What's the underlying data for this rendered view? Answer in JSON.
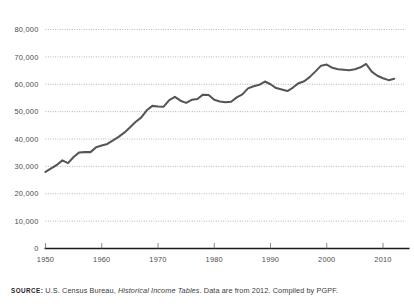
{
  "chart_data": {
    "type": "line",
    "title": "",
    "subtitle": "",
    "xlabel": "",
    "ylabel": "",
    "xlim": [
      1950,
      2014
    ],
    "ylim": [
      0,
      80000
    ],
    "grid": "horizontal-dotted",
    "legend": "none",
    "series_color": "#555555",
    "x_ticks": [
      "1950",
      "1960",
      "1970",
      "1980",
      "1990",
      "2000",
      "2010"
    ],
    "x_tick_values": [
      1950,
      1960,
      1970,
      1980,
      1990,
      2000,
      2010
    ],
    "y_ticks": [
      "0",
      "10,000",
      "20,000",
      "30,000",
      "40,000",
      "50,000",
      "60,000",
      "70,000",
      "80,000"
    ],
    "y_tick_values": [
      0,
      10000,
      20000,
      30000,
      40000,
      50000,
      60000,
      70000,
      80000
    ],
    "series": [
      {
        "name": "Median household income",
        "x": [
          1950,
          1951,
          1952,
          1953,
          1954,
          1955,
          1956,
          1957,
          1958,
          1959,
          1960,
          1961,
          1962,
          1963,
          1964,
          1965,
          1966,
          1967,
          1968,
          1969,
          1970,
          1971,
          1972,
          1973,
          1974,
          1975,
          1976,
          1977,
          1978,
          1979,
          1980,
          1981,
          1982,
          1983,
          1984,
          1985,
          1986,
          1987,
          1988,
          1989,
          1990,
          1991,
          1992,
          1993,
          1994,
          1995,
          1996,
          1997,
          1998,
          1999,
          2000,
          2001,
          2002,
          2003,
          2004,
          2005,
          2006,
          2007,
          2008,
          2009,
          2010,
          2011,
          2012
        ],
        "values": [
          28000,
          29300,
          30500,
          32200,
          31200,
          33400,
          35100,
          35200,
          35200,
          37000,
          37600,
          38200,
          39500,
          40800,
          42300,
          44200,
          46200,
          47800,
          50500,
          52100,
          51900,
          51800,
          54200,
          55400,
          54000,
          53200,
          54300,
          54600,
          56200,
          56100,
          54300,
          53700,
          53400,
          53600,
          55200,
          56300,
          58500,
          59300,
          59800,
          61000,
          60000,
          58600,
          58100,
          57500,
          58800,
          60400,
          61100,
          62700,
          64700,
          66800,
          67200,
          66000,
          65500,
          65300,
          65100,
          65500,
          66200,
          67400,
          64600,
          63100,
          62200,
          61500,
          62000
        ],
        "units": "2012 dollars"
      }
    ],
    "source": {
      "label": "SOURCE:",
      "text_before_italic": " U.S. Census Bureau, ",
      "italic_text": "Historical Income Tables",
      "text_after_italic": ". Data are from 2012. Compiled by PGPF."
    }
  }
}
